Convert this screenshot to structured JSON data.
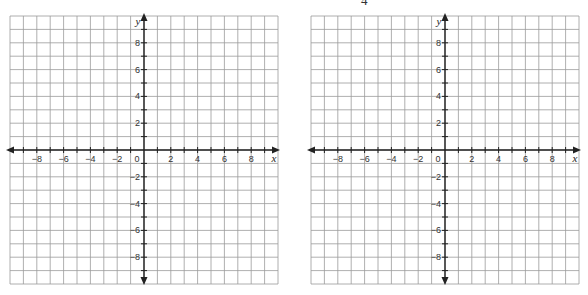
{
  "page": {
    "top_fragments": [
      {
        "id": "left",
        "text": "",
        "x": 20
      },
      {
        "id": "right",
        "text": "4",
        "x": 361
      }
    ]
  },
  "grids": [
    {
      "id": "left-grid",
      "left": 10,
      "x_axis_label": "x",
      "y_axis_label": "y",
      "x_ticks": [
        "-8",
        "-6",
        "-4",
        "-2",
        "0",
        "2",
        "4",
        "6",
        "8"
      ],
      "y_ticks": [
        "8",
        "6",
        "4",
        "2",
        "-2",
        "-4",
        "-6",
        "-8"
      ]
    },
    {
      "id": "right-grid",
      "left": 311,
      "x_axis_label": "x",
      "y_axis_label": "y",
      "x_ticks": [
        "-8",
        "-6",
        "-4",
        "-2",
        "0",
        "2",
        "4",
        "6",
        "8"
      ],
      "y_ticks": [
        "8",
        "6",
        "4",
        "2",
        "-2",
        "-4",
        "-6",
        "-8"
      ]
    }
  ],
  "style": {
    "grid_line_color": "#9a9a9a",
    "axis_color": "#222222",
    "cells": 20,
    "range_min": -10,
    "range_max": 10
  }
}
